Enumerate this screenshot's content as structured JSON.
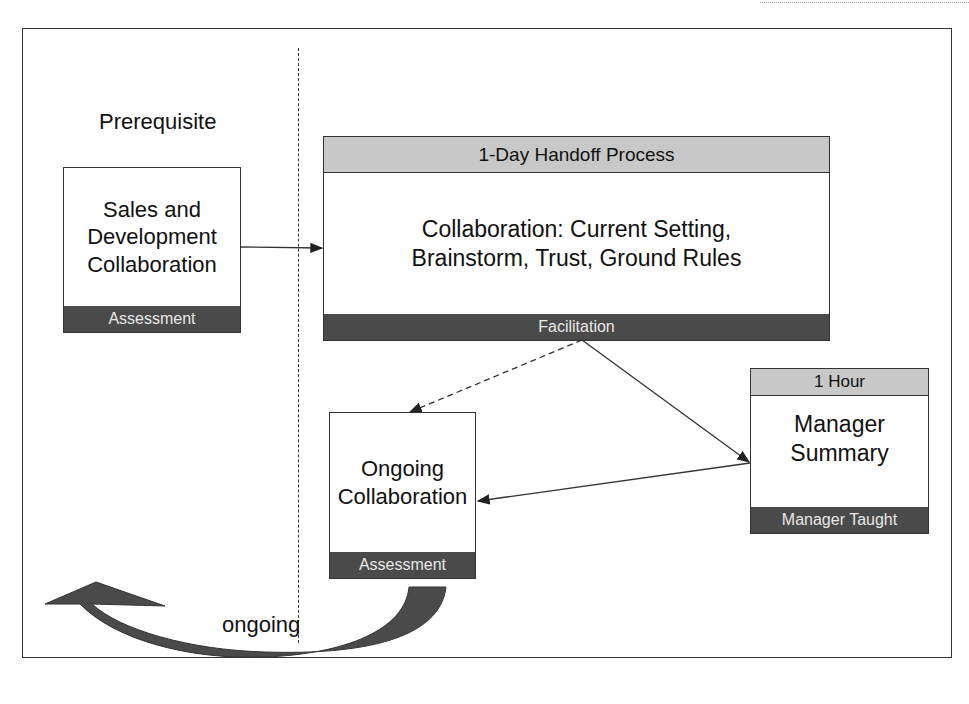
{
  "diagram": {
    "prerequisite_label": "Prerequisite",
    "ongoing_label": "ongoing",
    "boxes": {
      "sales_dev": {
        "body": "Sales and Development Collaboration",
        "footer": "Assessment"
      },
      "handoff": {
        "header": "1-Day Handoff Process",
        "body": "Collaboration: Current Setting, Brainstorm, Trust, Ground Rules",
        "footer": "Facilitation"
      },
      "ongoing": {
        "body": "Ongoing Collaboration",
        "footer": "Assessment"
      },
      "manager": {
        "header": "1 Hour",
        "body": "Manager Summary",
        "footer": "Manager Taught"
      }
    },
    "colors": {
      "header_fill": "#c8c8c8",
      "footer_fill": "#4a4a4a",
      "line": "#333333"
    }
  }
}
